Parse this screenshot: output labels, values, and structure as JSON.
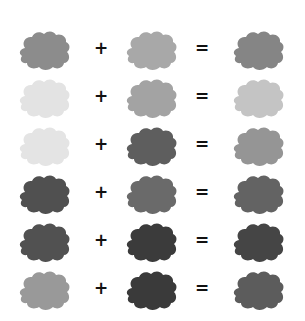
{
  "operators": {
    "plus": "+",
    "equals": "="
  },
  "rows": [
    {
      "a": {
        "color": "#8c8c8c"
      },
      "b": {
        "color": "#a8a8a8"
      },
      "result": {
        "color": "#858585"
      }
    },
    {
      "a": {
        "color": "#e3e3e3"
      },
      "b": {
        "color": "#a3a3a3"
      },
      "result": {
        "color": "#c4c4c4"
      }
    },
    {
      "a": {
        "color": "#e4e4e4"
      },
      "b": {
        "color": "#5e5e5e"
      },
      "result": {
        "color": "#959595"
      }
    },
    {
      "a": {
        "color": "#505050"
      },
      "b": {
        "color": "#6a6a6a"
      },
      "result": {
        "color": "#636363"
      }
    },
    {
      "a": {
        "color": "#515151"
      },
      "b": {
        "color": "#3b3b3b"
      },
      "result": {
        "color": "#454545"
      }
    },
    {
      "a": {
        "color": "#999999"
      },
      "b": {
        "color": "#3a3a3a"
      },
      "result": {
        "color": "#5c5c5c"
      }
    }
  ]
}
